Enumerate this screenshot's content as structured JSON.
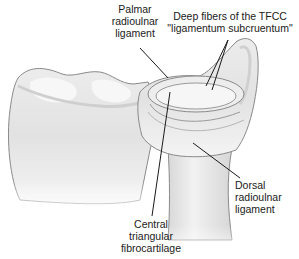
{
  "diagram": {
    "background_color": "#ffffff",
    "bone_fill": "#e6e6e6",
    "bone_outline": "#8a8a8a",
    "leader_line_color": "#1a1a1a",
    "labels": [
      {
        "id": "palmar",
        "lines": [
          "Palmar",
          "radioulnar",
          "ligament"
        ]
      },
      {
        "id": "deep",
        "lines": [
          "Deep fibers of the TFCC",
          "\"ligamentum subcruentum\""
        ]
      },
      {
        "id": "dorsal",
        "lines": [
          "Dorsal",
          "radioulnar",
          "ligament"
        ]
      },
      {
        "id": "central",
        "lines": [
          "Central",
          "triangular",
          "fibrocartilage"
        ]
      }
    ]
  }
}
